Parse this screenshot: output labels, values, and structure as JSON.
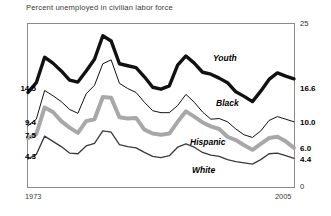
{
  "chart_data": {
    "type": "line",
    "title": "Percent unemployed in civilian labor force",
    "xlabel": "",
    "ylabel": "",
    "xlim": [
      1973,
      2005
    ],
    "ylim": [
      0,
      25
    ],
    "grid": false,
    "legend_position": "inline-right",
    "x_tick_labels": [
      "1973",
      "2005"
    ],
    "y_tick_labels_right": [
      "25",
      "16.6",
      "10.0",
      "6.0",
      "4.4",
      "0"
    ],
    "y_tick_values_right": [
      25,
      16.6,
      10.0,
      6.0,
      4.4,
      0
    ],
    "y_tick_labels_left": [
      "14.5",
      "9.4",
      "7.5",
      "4.3"
    ],
    "y_tick_values_left": [
      14.5,
      9.4,
      7.5,
      4.3
    ],
    "x": [
      1973,
      1974,
      1975,
      1976,
      1977,
      1978,
      1979,
      1980,
      1981,
      1982,
      1983,
      1984,
      1985,
      1986,
      1987,
      1988,
      1989,
      1990,
      1991,
      1992,
      1993,
      1994,
      1995,
      1996,
      1997,
      1998,
      1999,
      2000,
      2001,
      2002,
      2003,
      2004,
      2005
    ],
    "series": [
      {
        "name": "Youth",
        "color": "#111111",
        "line_width": 3.4,
        "start_value": 14.5,
        "end_value": 16.6,
        "values": [
          14.5,
          16.0,
          19.9,
          19.0,
          17.8,
          16.4,
          16.1,
          17.8,
          19.6,
          23.2,
          22.4,
          18.9,
          18.6,
          18.3,
          16.9,
          15.3,
          15.0,
          15.5,
          18.7,
          20.1,
          19.0,
          17.6,
          17.3,
          16.7,
          16.0,
          14.6,
          13.9,
          13.1,
          14.7,
          16.5,
          17.5,
          17.0,
          16.6
        ]
      },
      {
        "name": "Black",
        "color": "#111111",
        "line_width": 1.0,
        "start_value": 9.4,
        "end_value": 10.0,
        "values": [
          9.4,
          10.4,
          14.8,
          14.0,
          13.1,
          11.9,
          11.3,
          14.3,
          15.6,
          18.9,
          19.5,
          15.9,
          15.1,
          14.5,
          13.0,
          11.7,
          11.4,
          11.4,
          12.5,
          14.2,
          13.0,
          11.5,
          10.4,
          10.5,
          10.0,
          8.9,
          8.0,
          7.6,
          8.6,
          10.2,
          10.8,
          10.4,
          10.0
        ]
      },
      {
        "name": "Hispanic",
        "color": "#a8a8a8",
        "line_width": 4.0,
        "start_value": 7.5,
        "end_value": 6.0,
        "values": [
          7.5,
          8.1,
          12.2,
          11.5,
          10.1,
          9.1,
          8.3,
          10.1,
          10.4,
          13.8,
          13.7,
          10.7,
          10.5,
          10.6,
          8.8,
          8.2,
          8.0,
          8.2,
          10.0,
          11.6,
          10.8,
          9.9,
          9.3,
          8.9,
          7.7,
          7.2,
          6.4,
          5.7,
          6.6,
          7.5,
          7.7,
          7.0,
          6.0
        ]
      },
      {
        "name": "White",
        "color": "#3a3a3a",
        "line_width": 1.3,
        "start_value": 4.3,
        "end_value": 4.4,
        "values": [
          4.3,
          5.0,
          7.8,
          7.0,
          6.2,
          5.2,
          5.1,
          6.3,
          6.7,
          8.6,
          8.4,
          6.5,
          6.2,
          6.0,
          5.3,
          4.7,
          4.5,
          4.8,
          6.1,
          6.6,
          6.1,
          5.3,
          4.9,
          4.7,
          4.2,
          3.9,
          3.7,
          3.5,
          4.2,
          5.1,
          5.2,
          4.8,
          4.4
        ]
      }
    ],
    "annotations": [
      {
        "text": "Youth",
        "series": "Youth"
      },
      {
        "text": "Black",
        "series": "Black"
      },
      {
        "text": "Hispanic",
        "series": "Hispanic"
      },
      {
        "text": "White",
        "series": "White"
      }
    ]
  }
}
